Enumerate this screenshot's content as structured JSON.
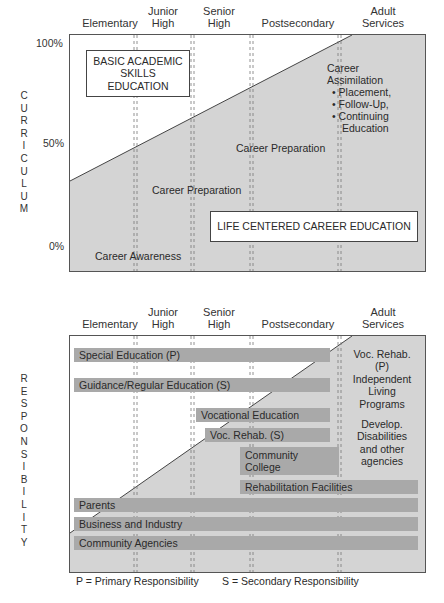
{
  "stages": [
    "Elementary",
    "Junior\nHigh",
    "Senior\nHigh",
    "Postsecondary",
    "Adult\nServices"
  ],
  "curriculum_panel": {
    "axis_label_letters": [
      "C",
      "U",
      "R",
      "R",
      "I",
      "C",
      "U",
      "L",
      "U",
      "M"
    ],
    "y_ticks": [
      "100%",
      "50%",
      "0%"
    ],
    "headers": {
      "elementary": "Elementary",
      "junior_high_1": "Junior",
      "junior_high_2": "High",
      "senior_high_1": "Senior",
      "senior_high_2": "High",
      "postsecondary": "Postsecondary",
      "adult_1": "Adult",
      "adult_2": "Services"
    },
    "basic_box": {
      "line1": "BASIC ACADEMIC",
      "line2": "SKILLS",
      "line3": "EDUCATION"
    },
    "lcce_box": "LIFE CENTERED CAREER EDUCATION",
    "labels": {
      "career_awareness": "Career Awareness",
      "career_preparation_low": "Career Preparation",
      "career_preparation_high": "Career Preparation",
      "career_assimilation_1": "Career",
      "career_assimilation_2": "Assimilation",
      "bullet_1": "• Placement,",
      "bullet_2": "• Follow-Up,",
      "bullet_3": "• Continuing",
      "bullet_3b": "Education"
    }
  },
  "responsibility_panel": {
    "axis_label_letters": [
      "R",
      "E",
      "S",
      "P",
      "O",
      "N",
      "S",
      "I",
      "B",
      "I",
      "L",
      "I",
      "T",
      "Y"
    ],
    "headers": {
      "elementary": "Elementary",
      "junior_high_1": "Junior",
      "junior_high_2": "High",
      "senior_high_1": "Senior",
      "senior_high_2": "High",
      "postsecondary": "Postsecondary",
      "adult_1": "Adult",
      "adult_2": "Services"
    },
    "bars": [
      {
        "label": "Special Education (P)"
      },
      {
        "label": "Guidance/Regular Education (S)"
      },
      {
        "label": "Vocational Education"
      },
      {
        "label": "Voc. Rehab. (S)"
      },
      {
        "label_1": "Community",
        "label_2": "College"
      },
      {
        "label": "Rehabilitation Facilities"
      },
      {
        "label": "Parents"
      },
      {
        "label": "Business and Industry"
      },
      {
        "label": "Community Agencies"
      }
    ],
    "adult_services_text": {
      "l1": "Voc. Rehab.",
      "l2": "(P)",
      "l3": "Independent",
      "l4": "Living",
      "l5": "Programs",
      "l6": "Develop.",
      "l7": "Disabilities",
      "l8": "and other",
      "l9": "agencies"
    }
  },
  "legend": {
    "primary": "P = Primary Responsibility",
    "secondary": "S = Secondary Responsibility"
  },
  "colors": {
    "shaded": "#d4d4d4",
    "bar": "#a9a9a9",
    "border": "#555555"
  }
}
